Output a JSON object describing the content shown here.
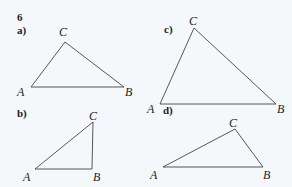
{
  "exercise_number": "6",
  "parts": [
    {
      "label": "a)",
      "label_pos": [
        17,
        34
      ],
      "vertices": {
        "A": [
          31,
          87
        ],
        "B": [
          124,
          87
        ],
        "C": [
          65,
          42
        ]
      },
      "vertex_labels": [
        {
          "name": "A",
          "pos": [
            17,
            96
          ]
        },
        {
          "name": "B",
          "pos": [
            125,
            96
          ]
        },
        {
          "name": "C",
          "pos": [
            59,
            36
          ]
        }
      ]
    },
    {
      "label": "b)",
      "label_pos": [
        17,
        117
      ],
      "vertices": {
        "A": [
          35,
          169
        ],
        "B": [
          92,
          169
        ],
        "C": [
          93,
          122
        ]
      },
      "vertex_labels": [
        {
          "name": "A",
          "pos": [
            23,
            181
          ]
        },
        {
          "name": "B",
          "pos": [
            93,
            181
          ]
        },
        {
          "name": "C",
          "pos": [
            89,
            120
          ]
        }
      ]
    },
    {
      "label": "c)",
      "label_pos": [
        164,
        33
      ],
      "vertices": {
        "A": [
          160,
          104
        ],
        "B": [
          276,
          104
        ],
        "C": [
          194,
          28
        ]
      },
      "vertex_labels": [
        {
          "name": "A",
          "pos": [
            147,
            113
          ]
        },
        {
          "name": "B",
          "pos": [
            277,
            113
          ]
        },
        {
          "name": "C",
          "pos": [
            189,
            25
          ]
        }
      ]
    },
    {
      "label": "d)",
      "label_pos": [
        163,
        114
      ],
      "vertices": {
        "A": [
          163,
          167
        ],
        "B": [
          263,
          167
        ],
        "C": [
          235,
          129
        ]
      },
      "vertex_labels": [
        {
          "name": "A",
          "pos": [
            150,
            179
          ]
        },
        {
          "name": "B",
          "pos": [
            263,
            179
          ]
        },
        {
          "name": "C",
          "pos": [
            229,
            127
          ]
        }
      ]
    }
  ],
  "colors": {
    "background": "#f5f8fb",
    "stroke": "#444444",
    "text": "#222222"
  }
}
